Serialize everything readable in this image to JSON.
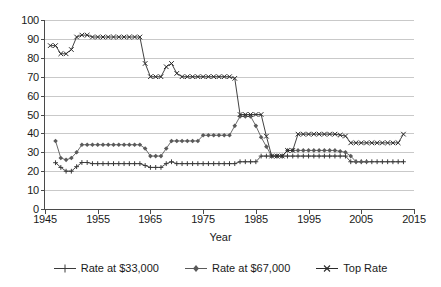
{
  "chart_data": {
    "type": "line",
    "title": "",
    "xlabel": "Year",
    "ylabel": "",
    "xlim": [
      1945,
      2015
    ],
    "ylim": [
      0,
      100
    ],
    "ytick_step": 10,
    "xtick_step": 10,
    "grid": true,
    "legend_position": "bottom",
    "yticks": [
      "0",
      "10",
      "20",
      "30",
      "40",
      "50",
      "60",
      "70",
      "80",
      "90",
      "100"
    ],
    "xticks": [
      "1945",
      "1955",
      "1965",
      "1975",
      "1985",
      "1995",
      "2005",
      "2015"
    ],
    "series": [
      {
        "name": "Rate at $33,000",
        "marker": "plus",
        "color": "#3a3a3a",
        "x": [
          1947,
          1948,
          1949,
          1950,
          1951,
          1952,
          1953,
          1954,
          1955,
          1956,
          1957,
          1958,
          1959,
          1960,
          1961,
          1962,
          1963,
          1964,
          1965,
          1966,
          1967,
          1968,
          1969,
          1970,
          1971,
          1972,
          1973,
          1974,
          1975,
          1976,
          1977,
          1978,
          1979,
          1980,
          1981,
          1982,
          1983,
          1984,
          1985,
          1986,
          1987,
          1988,
          1989,
          1990,
          1991,
          1992,
          1993,
          1994,
          1995,
          1996,
          1997,
          1998,
          1999,
          2000,
          2001,
          2002,
          2003,
          2004,
          2005,
          2006,
          2007,
          2008,
          2009,
          2010,
          2011,
          2012,
          2013
        ],
        "values": [
          24.5,
          22,
          20,
          20,
          22.4,
          24.6,
          24.6,
          24,
          24,
          24,
          24,
          24,
          24,
          24,
          24,
          24,
          24,
          23,
          22,
          22,
          22,
          24,
          25,
          24,
          24,
          24,
          24,
          24,
          24,
          24,
          24,
          24,
          24,
          24,
          24,
          25,
          25,
          25,
          25,
          28,
          28,
          28,
          28,
          28,
          28,
          28,
          28,
          28,
          28,
          28,
          28,
          28,
          28,
          28,
          28,
          28,
          25,
          25,
          25,
          25,
          25,
          25,
          25,
          25,
          25,
          25,
          25
        ]
      },
      {
        "name": "Rate at $67,000",
        "marker": "diamond",
        "color": "#5a5a5a",
        "x": [
          1947,
          1948,
          1949,
          1950,
          1951,
          1952,
          1953,
          1954,
          1955,
          1956,
          1957,
          1958,
          1959,
          1960,
          1961,
          1962,
          1963,
          1964,
          1965,
          1966,
          1967,
          1968,
          1969,
          1970,
          1971,
          1972,
          1973,
          1974,
          1975,
          1976,
          1977,
          1978,
          1979,
          1980,
          1981,
          1982,
          1983,
          1984,
          1985,
          1986,
          1987,
          1988,
          1989,
          1990,
          1991,
          1992,
          1993,
          1994,
          1995,
          1996,
          1997,
          1998,
          1999,
          2000,
          2001,
          2002,
          2003,
          2004,
          2005,
          2006
        ],
        "values": [
          36,
          27,
          26,
          27,
          30,
          34,
          34,
          34,
          34,
          34,
          34,
          34,
          34,
          34,
          34,
          34,
          34,
          32,
          28,
          28,
          28,
          32,
          36,
          36,
          36,
          36,
          36,
          36,
          39,
          39,
          39,
          39,
          39,
          39,
          44,
          49,
          49,
          49,
          44,
          38,
          33,
          28,
          28,
          28,
          31,
          31,
          31,
          31,
          31,
          31,
          31,
          31,
          31,
          31,
          30.5,
          30,
          28,
          25,
          25,
          25
        ]
      },
      {
        "name": "Top Rate",
        "marker": "x",
        "color": "#2b2b2b",
        "x": [
          1946,
          1947,
          1948,
          1949,
          1950,
          1951,
          1952,
          1953,
          1954,
          1955,
          1956,
          1957,
          1958,
          1959,
          1960,
          1961,
          1962,
          1963,
          1964,
          1965,
          1966,
          1967,
          1968,
          1969,
          1970,
          1971,
          1972,
          1973,
          1974,
          1975,
          1976,
          1977,
          1978,
          1979,
          1980,
          1981,
          1982,
          1983,
          1984,
          1985,
          1986,
          1987,
          1988,
          1989,
          1990,
          1991,
          1992,
          1993,
          1994,
          1995,
          1996,
          1997,
          1998,
          1999,
          2000,
          2001,
          2002,
          2003,
          2004,
          2005,
          2006,
          2007,
          2008,
          2009,
          2010,
          2011,
          2012,
          2013
        ],
        "values": [
          86.45,
          86.45,
          82.13,
          82.13,
          84.36,
          91,
          92,
          92,
          91,
          91,
          91,
          91,
          91,
          91,
          91,
          91,
          91,
          91,
          77,
          70,
          70,
          70,
          75.25,
          77,
          71.75,
          70,
          70,
          70,
          70,
          70,
          70,
          70,
          70,
          70,
          70,
          69.125,
          50,
          50,
          50,
          50,
          50,
          38.5,
          28,
          28,
          28,
          31,
          31,
          39.6,
          39.6,
          39.6,
          39.6,
          39.6,
          39.6,
          39.6,
          39.6,
          39.1,
          38.6,
          35,
          35,
          35,
          35,
          35,
          35,
          35,
          35,
          35,
          35,
          39.6
        ]
      }
    ]
  },
  "legend": {
    "items": [
      {
        "label": "Rate at $33,000"
      },
      {
        "label": "Rate at $67,000"
      },
      {
        "label": "Top Rate"
      }
    ]
  },
  "axis_title": {
    "x": "Year"
  }
}
